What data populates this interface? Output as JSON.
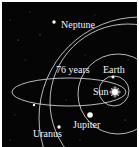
{
  "diagram": {
    "title": "",
    "background_color": "#050505",
    "line_color": "#e6e6e6",
    "labels": {
      "neptune": "Neptune",
      "comet_period": "76 years",
      "earth": "Earth",
      "sun": "Sun",
      "jupiter": "Jupiter",
      "uranus": "Uranus"
    },
    "bodies": [
      {
        "name": "Sun",
        "x": 114,
        "y": 91
      },
      {
        "name": "Earth",
        "x": 113,
        "y": 76
      },
      {
        "name": "Jupiter",
        "x": 89,
        "y": 114
      },
      {
        "name": "Uranus",
        "x": 58,
        "y": 127
      },
      {
        "name": "Neptune",
        "x": 53,
        "y": 21
      },
      {
        "name": "Comet",
        "x": 33,
        "y": 104
      }
    ],
    "orbits": [
      {
        "name": "Earth orbit",
        "type": "circle",
        "r": 14
      },
      {
        "name": "Jupiter orbit",
        "type": "circle",
        "r": 38
      },
      {
        "name": "Uranus orbit",
        "type": "circle",
        "r": 70
      },
      {
        "name": "Neptune orbit",
        "type": "circle",
        "r": 100
      },
      {
        "name": "Halley comet orbit",
        "type": "ellipse",
        "period": "76 years"
      }
    ]
  }
}
